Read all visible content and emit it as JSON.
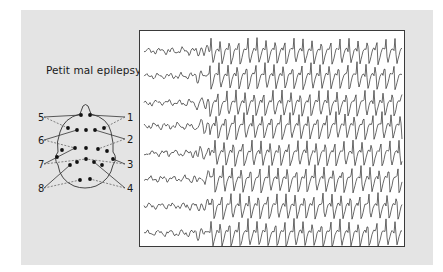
{
  "figure": {
    "title": "Petit mal epilepsy",
    "colors": {
      "page_background": "#ffffff",
      "panel_background": "#e4e4e4",
      "trace_box_background": "#ffffff",
      "trace_color": "#2a2a2a",
      "electrode_color": "#111111"
    }
  },
  "head_diagram": {
    "channel_labels": [
      {
        "id": "5",
        "side": "left",
        "x": 38,
        "y": 121
      },
      {
        "id": "6",
        "side": "left",
        "x": 38,
        "y": 144
      },
      {
        "id": "7",
        "side": "left",
        "x": 38,
        "y": 168
      },
      {
        "id": "8",
        "side": "left",
        "x": 38,
        "y": 192
      },
      {
        "id": "1",
        "side": "right",
        "x": 127,
        "y": 121
      },
      {
        "id": "2",
        "side": "right",
        "x": 127,
        "y": 143
      },
      {
        "id": "3",
        "side": "right",
        "x": 127,
        "y": 168
      },
      {
        "id": "4",
        "side": "right",
        "x": 127,
        "y": 192
      }
    ],
    "electrodes": [
      [
        81,
        115
      ],
      [
        90,
        115
      ],
      [
        68,
        128
      ],
      [
        77,
        130
      ],
      [
        86,
        130
      ],
      [
        95,
        130
      ],
      [
        104,
        128
      ],
      [
        62,
        150
      ],
      [
        75,
        148
      ],
      [
        86,
        148
      ],
      [
        98,
        149
      ],
      [
        107,
        151
      ],
      [
        57,
        157
      ],
      [
        113,
        159
      ],
      [
        70,
        165
      ],
      [
        77,
        162
      ],
      [
        86,
        159
      ],
      [
        94,
        162
      ],
      [
        102,
        165
      ],
      [
        80,
        180
      ],
      [
        90,
        179
      ]
    ],
    "connections": [
      {
        "label": "5",
        "solid_to": [
          81,
          115
        ],
        "dashed_to": [
          68,
          128
        ]
      },
      {
        "label": "6",
        "solid_to": [
          77,
          130
        ],
        "dashed_to": [
          75,
          148
        ]
      },
      {
        "label": "7",
        "solid_to": [
          75,
          148
        ],
        "dashed_to": [
          86,
          159
        ]
      },
      {
        "label": "8",
        "solid_to": [
          70,
          165
        ],
        "dashed_to": [
          80,
          180
        ]
      },
      {
        "label": "1",
        "solid_to": [
          90,
          115
        ],
        "dashed_to": [
          104,
          128
        ]
      },
      {
        "label": "2",
        "solid_to": [
          95,
          130
        ],
        "dashed_to": [
          98,
          149
        ]
      },
      {
        "label": "3",
        "solid_to": [
          113,
          159
        ],
        "dashed_to": [
          86,
          159
        ]
      },
      {
        "label": "4",
        "solid_to": [
          94,
          162
        ],
        "dashed_to": [
          90,
          179
        ]
      }
    ]
  },
  "eeg": {
    "channel_count": 8,
    "baselines_y": [
      20,
      45,
      72,
      95,
      122,
      148,
      175,
      202
    ],
    "seizure_onset_x": 70,
    "spike_wave_period_px": 9.2,
    "pre_onset_amplitude_px": 4,
    "seizure_amplitude_px": 14,
    "pattern": "3 Hz generalized spike-and-wave discharge"
  }
}
